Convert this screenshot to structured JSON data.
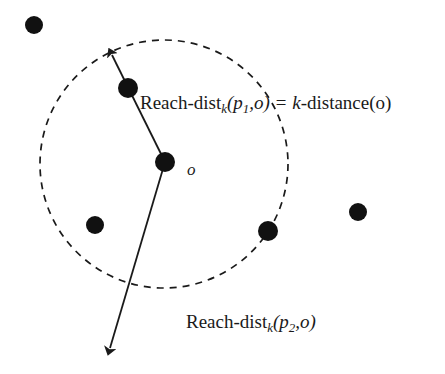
{
  "figure": {
    "background_color": "#ffffff",
    "stroke_color": "#1a1a1a",
    "dot_color": "#111111",
    "labels": {
      "reach_dist_p1": {
        "prefix": "Reach-dist",
        "sub_k": "k",
        "args": "(p",
        "sub_1": "1",
        "args_tail": ",o) = ",
        "eq_k": "k",
        "eq_tail": "-distance(o)",
        "full_text": "Reach-dist_k(p_1,o) = k-distance(o)"
      },
      "reach_dist_p2": {
        "prefix": "Reach-dist",
        "sub_k": "k",
        "args": "(p",
        "sub_2": "2",
        "args_tail": ",o)",
        "full_text": "Reach-dist_k(p_2,o)"
      },
      "center_point": "o"
    },
    "geometry": {
      "circle": {
        "cx": 164,
        "cy": 164,
        "r": 124,
        "dashed": true
      },
      "dots": [
        {
          "name": "dot-outside-top-left",
          "cx": 34,
          "cy": 25,
          "r": 9
        },
        {
          "name": "dot-p1",
          "cx": 128,
          "cy": 88,
          "r": 10
        },
        {
          "name": "dot-center-o",
          "cx": 165,
          "cy": 162,
          "r": 10
        },
        {
          "name": "dot-inner-lower-left",
          "cx": 95,
          "cy": 225,
          "r": 9
        },
        {
          "name": "dot-on-circle-right",
          "cx": 268,
          "cy": 231,
          "r": 10
        },
        {
          "name": "dot-outside-right",
          "cx": 358,
          "cy": 212,
          "r": 9
        }
      ],
      "arrow_up": {
        "from": [
          128,
          88
        ],
        "to": [
          108,
          48
        ]
      },
      "arrow_down": {
        "from": [
          165,
          162
        ],
        "to": [
          107,
          357
        ]
      },
      "segment_p1_to_o": {
        "from": [
          128,
          88
        ],
        "to": [
          165,
          162
        ]
      }
    }
  }
}
